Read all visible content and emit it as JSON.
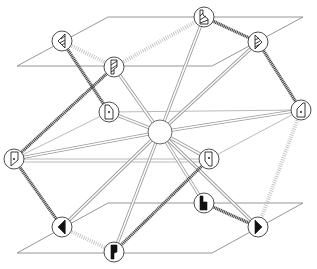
{
  "diagram": {
    "type": "layered-network-sketch",
    "colors": {
      "plane_stroke": "#8a8a8a",
      "dark_edge": "#4a4a4a",
      "hatched_edge": "#bdbdbd",
      "double_edge": "#9a9a9a",
      "node_stroke": "#3a3a3a",
      "glyph_fill": "#111111"
    },
    "planes": [
      {
        "id": "top-plane",
        "points": "17,66 108,17 303,17 212,66"
      },
      {
        "id": "bottom-plane",
        "points": "17,253 108,203 303,203 212,253"
      }
    ],
    "hub": {
      "id": "center-hub",
      "x": 160,
      "y": 132,
      "r": 12
    },
    "nodes": [
      {
        "id": "A",
        "layer": "top",
        "x": 62,
        "y": 41,
        "glyph": "outline-left-wedge-hatched"
      },
      {
        "id": "B",
        "layer": "top",
        "x": 114,
        "y": 67,
        "glyph": "outline-flag-hatched"
      },
      {
        "id": "C",
        "layer": "top",
        "x": 204,
        "y": 17,
        "glyph": "outline-step-hatched"
      },
      {
        "id": "D",
        "layer": "top",
        "x": 258,
        "y": 42,
        "glyph": "outline-right-wedge-hatched"
      },
      {
        "id": "E",
        "layer": "middle",
        "x": 109,
        "y": 112,
        "glyph": "outline-door-dot"
      },
      {
        "id": "F",
        "layer": "middle",
        "x": 301,
        "y": 110,
        "glyph": "outline-door-dot-slant"
      },
      {
        "id": "G",
        "layer": "middle",
        "x": 14,
        "y": 159,
        "glyph": "outline-door-dot"
      },
      {
        "id": "H",
        "layer": "middle",
        "x": 209,
        "y": 159,
        "glyph": "outline-door-dot"
      },
      {
        "id": "I",
        "layer": "bottom",
        "x": 62,
        "y": 227,
        "glyph": "solid-left-wedge"
      },
      {
        "id": "J",
        "layer": "bottom",
        "x": 114,
        "y": 252,
        "glyph": "solid-flag"
      },
      {
        "id": "K",
        "layer": "bottom",
        "x": 204,
        "y": 203,
        "glyph": "solid-step"
      },
      {
        "id": "L",
        "layer": "bottom",
        "x": 258,
        "y": 227,
        "glyph": "solid-right-wedge"
      }
    ],
    "edges": [
      {
        "from": "A",
        "to": "E",
        "style": "dark"
      },
      {
        "from": "B",
        "to": "G",
        "style": "dark"
      },
      {
        "from": "C",
        "to": "D",
        "style": "dark"
      },
      {
        "from": "D",
        "to": "F",
        "style": "dark"
      },
      {
        "from": "G",
        "to": "I",
        "style": "dark"
      },
      {
        "from": "H",
        "to": "J",
        "style": "dark"
      },
      {
        "from": "K",
        "to": "L",
        "style": "dark"
      },
      {
        "from": "A",
        "to": "B",
        "style": "hatched"
      },
      {
        "from": "B",
        "to": "C",
        "style": "hatched"
      },
      {
        "from": "I",
        "to": "J",
        "style": "hatched"
      },
      {
        "from": "F",
        "to": "L",
        "style": "hatched"
      },
      {
        "from": "hub",
        "to": "B",
        "style": "double"
      },
      {
        "from": "hub",
        "to": "C",
        "style": "double"
      },
      {
        "from": "hub",
        "to": "D",
        "style": "double"
      },
      {
        "from": "hub",
        "to": "E",
        "style": "double"
      },
      {
        "from": "hub",
        "to": "F",
        "style": "double"
      },
      {
        "from": "hub",
        "to": "G",
        "style": "double"
      },
      {
        "from": "hub",
        "to": "H",
        "style": "double"
      },
      {
        "from": "hub",
        "to": "I",
        "style": "double"
      },
      {
        "from": "hub",
        "to": "J",
        "style": "double"
      },
      {
        "from": "hub",
        "to": "K",
        "style": "double"
      },
      {
        "from": "hub",
        "to": "L",
        "style": "double"
      },
      {
        "from": "E",
        "to": "G",
        "style": "thin"
      },
      {
        "from": "E",
        "to": "F",
        "style": "thin"
      },
      {
        "from": "G",
        "to": "H",
        "style": "thin"
      },
      {
        "from": "H",
        "to": "F",
        "style": "thin"
      }
    ]
  }
}
